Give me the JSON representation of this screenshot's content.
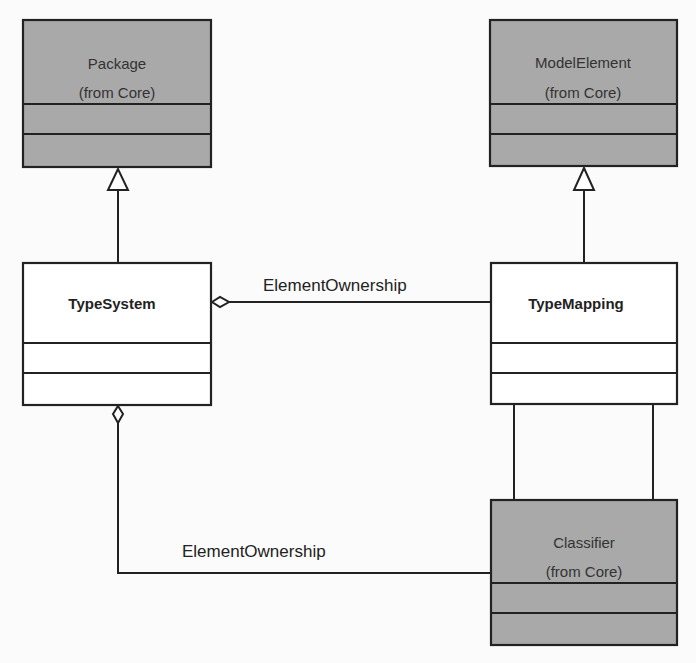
{
  "diagram": {
    "type": "UML class diagram",
    "classes": [
      {
        "id": "package",
        "name": "Package",
        "stereotype": "(from Core)",
        "shaded": true
      },
      {
        "id": "model-element",
        "name": "ModelElement",
        "stereotype": "(from Core)",
        "shaded": true
      },
      {
        "id": "type-system",
        "name": "TypeSystem",
        "shaded": false
      },
      {
        "id": "type-mapping",
        "name": "TypeMapping",
        "shaded": false
      },
      {
        "id": "classifier",
        "name": "Classifier",
        "stereotype": "(from Core)",
        "shaded": true
      }
    ],
    "relationships": [
      {
        "type": "generalization",
        "from": "TypeSystem",
        "to": "Package"
      },
      {
        "type": "generalization",
        "from": "TypeMapping",
        "to": "ModelElement"
      },
      {
        "type": "aggregation",
        "owner": "TypeSystem",
        "part": "TypeMapping",
        "label": "ElementOwnership"
      },
      {
        "type": "aggregation",
        "owner": "TypeSystem",
        "part": "Classifier",
        "label": "ElementOwnership"
      },
      {
        "type": "association",
        "from": "TypeMapping",
        "to": "Classifier",
        "count": 2
      }
    ]
  },
  "labels": {
    "package_name": "Package",
    "package_from": "(from Core)",
    "model_element_name": "ModelElement",
    "model_element_from": "(from Core)",
    "type_system_name": "TypeSystem",
    "type_mapping_name": "TypeMapping",
    "classifier_name": "Classifier",
    "classifier_from": "(from Core)",
    "ownership_top": "ElementOwnership",
    "ownership_bottom": "ElementOwnership"
  },
  "colors": {
    "core_fill": "#a9a9a9",
    "local_fill": "#ffffff",
    "line": "#222222"
  }
}
